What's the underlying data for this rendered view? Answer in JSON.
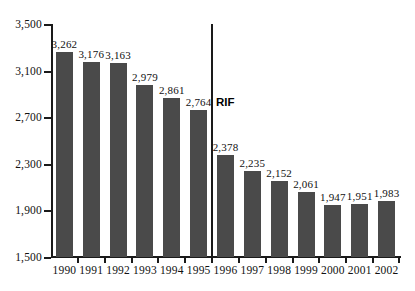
{
  "chart_data": {
    "type": "bar",
    "title": "",
    "xlabel": "",
    "ylabel": "",
    "categories": [
      "1990",
      "1991",
      "1992",
      "1993",
      "1994",
      "1995",
      "1996",
      "1997",
      "1998",
      "1999",
      "2000",
      "2001",
      "2002"
    ],
    "values": [
      3262,
      3176,
      3163,
      2979,
      2861,
      2764,
      2378,
      2235,
      2152,
      2061,
      1947,
      1951,
      1983
    ],
    "value_labels": [
      "3,262",
      "3,176",
      "3,163",
      "2,979",
      "2,861",
      "2,764",
      "2,378",
      "2,235",
      "2,152",
      "2,061",
      "1,947",
      "1,951",
      "1,983"
    ],
    "ylim": [
      1500,
      3500
    ],
    "ytick_values": [
      1500,
      1900,
      2300,
      2700,
      3100,
      3500
    ],
    "ytick_labels": [
      "1,500",
      "1,900",
      "2,300",
      "2,700",
      "3,100",
      "3,500"
    ],
    "grid": false,
    "legend": null,
    "bar_color": "#4a4a4a",
    "axis_color": "#1a1a1a",
    "annotations": [
      {
        "text": "RIF",
        "type": "vertical-divider-with-label",
        "between": [
          "1995",
          "1996"
        ],
        "label_value": 2764
      }
    ]
  }
}
